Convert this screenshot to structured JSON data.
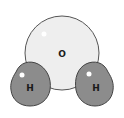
{
  "diagram": {
    "atoms": [
      {
        "id": "oxygen",
        "label": "O",
        "fill": "#eeeeee",
        "stroke": "#555555"
      },
      {
        "id": "hydrogen-left",
        "label": "H",
        "fill": "#8c8c8c",
        "stroke": "#444444"
      },
      {
        "id": "hydrogen-right",
        "label": "H",
        "fill": "#8c8c8c",
        "stroke": "#444444"
      }
    ]
  }
}
